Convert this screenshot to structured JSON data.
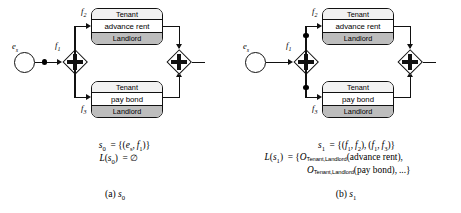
{
  "figure": {
    "panels": [
      {
        "id": "a",
        "subcaption_prefix": "(a)",
        "subcaption_symbol": "s",
        "subcaption_index": "0",
        "start_event_label": "e",
        "start_event_sub": "s",
        "split_gateway_label": "f",
        "split_gateway_sub": "1",
        "top_flow_label": "f",
        "top_flow_sub": "2",
        "bottom_flow_label": "f",
        "bottom_flow_sub": "3",
        "top_task": {
          "header": "Tenant",
          "name": "advance rent",
          "footer": "Landlord"
        },
        "bottom_task": {
          "header": "Tenant",
          "name": "pay bond",
          "footer": "Landlord"
        },
        "tokens": [
          {
            "name": "token-on-start-flow"
          }
        ],
        "formula_lines": [
          {
            "lhs": "s",
            "lhs_sub": "0",
            "rel": "=",
            "rhs": "{(eₛ, f₁)}"
          },
          {
            "lhs": "L(s",
            "lhs_sub": "0",
            "rel": ") =",
            "rhs": "∅"
          }
        ],
        "formula_text": [
          "s₀  = {(eₛ, f₁)}",
          "L(s₀) = ∅"
        ]
      },
      {
        "id": "b",
        "subcaption_prefix": "(b)",
        "subcaption_symbol": "s",
        "subcaption_index": "1",
        "start_event_label": "e",
        "start_event_sub": "s",
        "split_gateway_label": "f",
        "split_gateway_sub": "1",
        "top_flow_label": "f",
        "top_flow_sub": "2",
        "bottom_flow_label": "f",
        "bottom_flow_sub": "3",
        "top_task": {
          "header": "Tenant",
          "name": "advance rent",
          "footer": "Landlord"
        },
        "bottom_task": {
          "header": "Tenant",
          "name": "pay bond",
          "footer": "Landlord"
        },
        "tokens": [
          {
            "name": "token-on-upper-branch-flow"
          },
          {
            "name": "token-on-lower-branch-flow"
          }
        ],
        "formula_text": [
          "s₁  = {(f₁, f₂), (f₁, f₃)}",
          "L(s₁) = {Oₜ(advance rent),",
          "Oₜ(pay bond), ...}"
        ]
      }
    ],
    "panel_a_formula": {
      "line1_lhs": "s",
      "line1_sub": "0",
      "line1_rhs": "= {(e",
      "line1_rhs_sub": "s",
      "line1_rhs2": ", f",
      "line1_rhs2_sub": "1",
      "line1_rhs3": ")}",
      "line2_lhs": "L(s",
      "line2_sub": "0",
      "line2_rhs": ") = ∅"
    },
    "panel_b_formula": {
      "line1": "s₁  = {(f₁, f₂), (f₁, f₃)}",
      "line2_lhs": "L(s₁) = {O",
      "line2_roles": "Tenant,Landlord",
      "line2_rhs": "(advance rent),",
      "line3_lhs": "O",
      "line3_roles": "Tenant,Landlord",
      "line3_rhs": "(pay bond), ...}"
    },
    "labels": {
      "empty_set": "∅",
      "operator_O": "O",
      "roles_subscript": "Tenant,Landlord"
    }
  }
}
